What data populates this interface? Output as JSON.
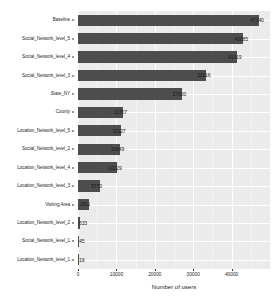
{
  "chart_data": {
    "type": "bar",
    "orientation": "horizontal",
    "title": "",
    "xlabel": "Number of users",
    "ylabel": "",
    "xlim": [
      0,
      50000
    ],
    "ylim": null,
    "grid": true,
    "legend": false,
    "legend_position": "none",
    "bar_color": "#4d4d4d",
    "panel_color": "#ebebeb",
    "gridline_color": "#ffffff",
    "xticks": [
      0,
      10000,
      20000,
      30000,
      40000
    ],
    "xticklabels": [
      "0",
      "10000",
      "20000",
      "30000",
      "40000"
    ],
    "categories": [
      "Baseline",
      "Social_Network_level_5",
      "Social_Network_level_4",
      "Social_Network_level_3",
      "State_NY",
      "County",
      "Location_Network_level_5",
      "Social_Network_level_2",
      "Location_Network_level_4",
      "Location_Network_level_3",
      "Visiting Area",
      "Location_Network_level_2",
      "Social_Network_level_1",
      "Location_Network_level_1"
    ],
    "values": [
      47240,
      43085,
      41419,
      33316,
      27000,
      11707,
      11327,
      10849,
      10229,
      5770,
      2811,
      633,
      45,
      19
    ],
    "value_labels": [
      "47240",
      "43085",
      "41419",
      "33316",
      "27000",
      "11707",
      "11327",
      "10849",
      "10229",
      "5770",
      "2811",
      "633",
      "45",
      "19"
    ]
  }
}
